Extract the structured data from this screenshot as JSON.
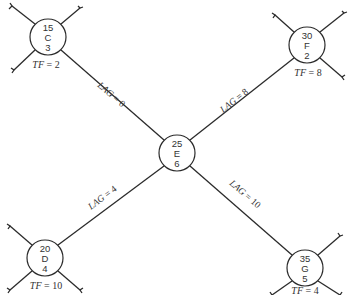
{
  "diagram": {
    "type": "activity-on-node network (precedence diagram)",
    "nodes": [
      {
        "id": "C",
        "es": "15",
        "label": "C",
        "duration": "3",
        "tf_label": "TF",
        "tf_value": "2",
        "cx": 48,
        "cy": 37
      },
      {
        "id": "F",
        "es": "30",
        "label": "F",
        "duration": "2",
        "tf_label": "TF",
        "tf_value": "8",
        "cx": 307,
        "cy": 45
      },
      {
        "id": "E",
        "es": "25",
        "label": "E",
        "duration": "6",
        "tf_label": "",
        "tf_value": "",
        "cx": 177,
        "cy": 153
      },
      {
        "id": "D",
        "es": "20",
        "label": "D",
        "duration": "4",
        "tf_label": "TF",
        "tf_value": "10",
        "cx": 45,
        "cy": 258
      },
      {
        "id": "G",
        "es": "35",
        "label": "G",
        "duration": "5",
        "tf_label": "TF",
        "tf_value": "4",
        "cx": 305,
        "cy": 268
      }
    ],
    "edges": [
      {
        "from": "C",
        "to": "E",
        "lag_label": "LAG",
        "lag_value": "0"
      },
      {
        "from": "E",
        "to": "F",
        "lag_label": "LAG",
        "lag_value": "8"
      },
      {
        "from": "D",
        "to": "E",
        "lag_label": "LAG",
        "lag_value": "4"
      },
      {
        "from": "E",
        "to": "G",
        "lag_label": "LAG",
        "lag_value": "10"
      }
    ],
    "equals_sign": "="
  }
}
